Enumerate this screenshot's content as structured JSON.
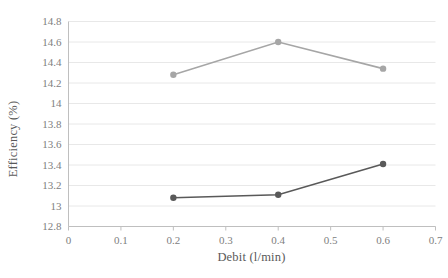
{
  "chart_data": {
    "type": "line",
    "title": "",
    "subtitle": "",
    "xlabel": "Debit (l/min)",
    "ylabel": "Efficiency (%)",
    "x": [
      0.2,
      0.4,
      0.6
    ],
    "xlim": [
      0,
      0.7
    ],
    "ylim": [
      12.8,
      14.8
    ],
    "x_ticks": [
      "0",
      "0.1",
      "0.2",
      "0.3",
      "0.4",
      "0.5",
      "0.6",
      "0.7"
    ],
    "x_tick_values": [
      0,
      0.1,
      0.2,
      0.3,
      0.4,
      0.5,
      0.6,
      0.7
    ],
    "y_ticks": [
      "12.8",
      "13",
      "13.2",
      "13.4",
      "13.6",
      "13.8",
      "14",
      "14.2",
      "14.4",
      "14.6",
      "14.8"
    ],
    "y_tick_values": [
      12.8,
      13,
      13.2,
      13.4,
      13.6,
      13.8,
      14,
      14.2,
      14.4,
      14.6,
      14.8
    ],
    "grid": "horizontal",
    "legend": "none",
    "series": [
      {
        "name": "upper-series",
        "color": "#a6a6a6",
        "values": [
          14.28,
          14.6,
          14.34
        ]
      },
      {
        "name": "lower-series",
        "color": "#595959",
        "values": [
          13.08,
          13.11,
          13.41
        ]
      }
    ],
    "annotations": []
  },
  "axes": {
    "y_title": "Efficiency (%)",
    "x_title": "Debit (l/min)"
  },
  "colors": {
    "background": "#ffffff",
    "gridline": "#e8e8e8",
    "axis_line": "#bfbfbf",
    "tick_label": "#808080",
    "axis_title": "#595959",
    "series_upper": "#a6a6a6",
    "series_lower": "#595959"
  }
}
